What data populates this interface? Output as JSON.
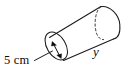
{
  "figure": {
    "kind": "geometry-diagram",
    "shape": "cylinder",
    "title": "",
    "stroke_color": "#1a1a1a",
    "background_color": "#ffffff",
    "labels": {
      "radius": "5 cm",
      "height": "y"
    },
    "annotations": {
      "radius_label": "5 cm",
      "radius_label_name": "radius-dimension-label",
      "height_label": "y",
      "height_label_name": "height-dimension-label",
      "radius_arrow": "double-headed-arrow",
      "leader_line": "leader-line-from-radius-label",
      "hidden_edge_style": "dashed",
      "visible_edge_style": "solid"
    },
    "icons": {
      "near_cap": "ellipse-icon",
      "far_cap_hidden": "dashed-ellipse-icon",
      "far_cap_visible": "arc-icon",
      "radius_arrow": "double-arrow-icon"
    }
  }
}
